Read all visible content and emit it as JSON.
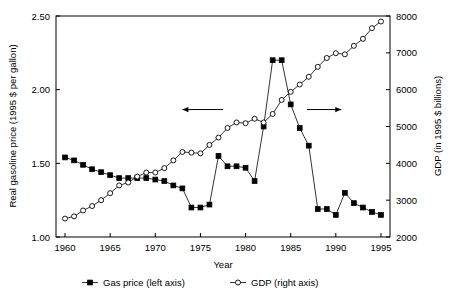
{
  "chart_data": {
    "type": "line",
    "title": "",
    "xlabel": "Year",
    "ylabel": "Real gasoline price (1995 $ per gallon)",
    "y2label": "GDP (in 1995 $ billions)",
    "x": [
      1960,
      1961,
      1962,
      1963,
      1964,
      1965,
      1966,
      1967,
      1968,
      1969,
      1970,
      1971,
      1972,
      1973,
      1974,
      1975,
      1976,
      1977,
      1978,
      1979,
      1980,
      1981,
      1982,
      1983,
      1984,
      1985,
      1986,
      1987,
      1988,
      1989,
      1990,
      1991,
      1992,
      1993,
      1994,
      1995
    ],
    "xlim": [
      1959,
      1996
    ],
    "ylim": [
      1.0,
      2.5
    ],
    "y2lim": [
      2000,
      8000
    ],
    "xticks": [
      1960,
      1965,
      1970,
      1975,
      1980,
      1985,
      1990,
      1995
    ],
    "yticks": [
      1.0,
      1.5,
      2.0,
      2.5
    ],
    "ytick_labels": [
      "1.00",
      "1.50",
      "2.00",
      "2.50"
    ],
    "y2ticks": [
      2000,
      3000,
      4000,
      5000,
      6000,
      7000,
      8000
    ],
    "y2tick_labels": [
      "2000",
      "3000",
      "4000",
      "5000",
      "6000",
      "7000",
      "8000"
    ],
    "grid": false,
    "legend_position": "below-axes",
    "series": [
      {
        "name": "Gas price (left axis)",
        "axis": "left",
        "marker": "filled-square",
        "color": "#000000",
        "values": [
          1.54,
          1.52,
          1.49,
          1.46,
          1.44,
          1.42,
          1.4,
          1.4,
          1.4,
          1.4,
          1.39,
          1.38,
          1.35,
          1.33,
          1.2,
          1.2,
          1.22,
          1.55,
          1.48,
          1.48,
          1.47,
          1.38,
          1.75,
          2.2,
          2.2,
          1.9,
          1.74,
          1.62,
          1.19,
          1.19,
          1.15,
          1.3,
          1.23,
          1.2,
          1.17,
          1.15
        ]
      },
      {
        "name": "GDP (right axis)",
        "axis": "right",
        "marker": "open-circle",
        "color": "#000000",
        "values": [
          2500,
          2560,
          2720,
          2840,
          3000,
          3190,
          3400,
          3480,
          3640,
          3750,
          3750,
          3870,
          4080,
          4310,
          4290,
          4270,
          4500,
          4700,
          4960,
          5110,
          5090,
          5210,
          5110,
          5340,
          5720,
          5940,
          6140,
          6350,
          6620,
          6860,
          6990,
          6960,
          7190,
          7380,
          7670,
          7850
        ]
      }
    ],
    "annotations": [
      {
        "name": "left-arrow",
        "direction": "left",
        "x_start": 1977.5,
        "x_end": 1973.0,
        "y_value": 1.865
      },
      {
        "name": "right-arrow",
        "direction": "right",
        "x_start": 1986.8,
        "x_end": 1990.6,
        "y_value": 1.865
      }
    ]
  },
  "legend": {
    "items": [
      {
        "label": "Gas price (left axis)",
        "marker": "filled-square"
      },
      {
        "label": "GDP (right axis)",
        "marker": "open-circle"
      }
    ]
  }
}
